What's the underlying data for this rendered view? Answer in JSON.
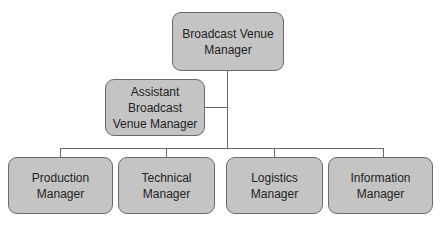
{
  "diagram": {
    "type": "org-chart",
    "root": {
      "label": "Broadcast Venue\nManager"
    },
    "assistant": {
      "label": "Assistant Broadcast\nVenue Manager",
      "reports_to": "Broadcast Venue Manager"
    },
    "reports": [
      {
        "label": "Production Manager"
      },
      {
        "label": "Technical Manager"
      },
      {
        "label": "Logistics Manager"
      },
      {
        "label": "Information Manager"
      }
    ],
    "colors": {
      "box_fill": "#c4c4c4",
      "box_border": "#6a6a6a",
      "connector": "#6a6a6a"
    }
  }
}
